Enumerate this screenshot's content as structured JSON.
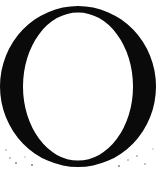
{
  "image": {
    "kind": "glyph-specimen",
    "character": "O",
    "character_name": "latin-capital-letter-o",
    "typeface_style": "didone-modern-serif",
    "width": 163,
    "height": 171,
    "background_color": "#ffffff",
    "ink_color": "#0b0a0a",
    "alt_text": "Large black serif capital letter O on a white background"
  },
  "glyph": {
    "label": "O",
    "outer_ellipse": {
      "center_x": 78,
      "center_y": 86.5,
      "radius_x": 78,
      "radius_y": 80.5
    },
    "counter_ellipse": {
      "center_x": 78,
      "center_y": 86.5,
      "radius_x": 55,
      "radius_y": 74
    },
    "stroke_thickness_side_px": 23,
    "stroke_thickness_apex_px": 6,
    "contrast_ratio": "3.8:1",
    "bounds": {
      "left": 0,
      "top": 6,
      "right": 156,
      "bottom": 167
    }
  },
  "artifacts": {
    "description": "scan speckle near lower corners",
    "specks": [
      {
        "x": 10,
        "y": 158,
        "r": 1.1
      },
      {
        "x": 16,
        "y": 163,
        "r": 0.9
      },
      {
        "x": 25,
        "y": 157,
        "r": 0.8
      },
      {
        "x": 32,
        "y": 165,
        "r": 1.0
      },
      {
        "x": 6,
        "y": 150,
        "r": 0.9
      },
      {
        "x": 128,
        "y": 160,
        "r": 1.0
      },
      {
        "x": 137,
        "y": 156,
        "r": 0.8
      },
      {
        "x": 145,
        "y": 164,
        "r": 1.1
      },
      {
        "x": 119,
        "y": 166,
        "r": 0.9
      },
      {
        "x": 153,
        "y": 149,
        "r": 0.8
      }
    ]
  }
}
